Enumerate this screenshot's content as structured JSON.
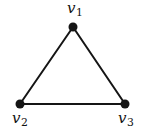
{
  "figure": {
    "type": "graph-diagram",
    "background": "#ffffff",
    "edge_color": "#151515",
    "edge_width": 2,
    "vertex_fill": "#151515",
    "vertex_radius": 4.5,
    "vertices": [
      {
        "id": "v1",
        "label": "v",
        "subscript": "1",
        "x": 73,
        "y": 27,
        "label_cx": 75,
        "label_top": 1
      },
      {
        "id": "v2",
        "label": "v",
        "subscript": "2",
        "x": 20,
        "y": 104,
        "label_cx": 20,
        "label_top": 111
      },
      {
        "id": "v3",
        "label": "v",
        "subscript": "3",
        "x": 125,
        "y": 104,
        "label_cx": 126,
        "label_top": 111
      }
    ],
    "edges": [
      [
        "v1",
        "v2"
      ],
      [
        "v2",
        "v3"
      ],
      [
        "v1",
        "v3"
      ]
    ]
  }
}
